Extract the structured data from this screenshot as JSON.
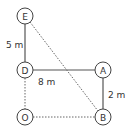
{
  "diagram": {
    "nodes": [
      {
        "id": "E",
        "label": "E"
      },
      {
        "id": "D",
        "label": "D"
      },
      {
        "id": "A",
        "label": "A"
      },
      {
        "id": "O",
        "label": "O"
      },
      {
        "id": "B",
        "label": "B"
      }
    ],
    "edges": [
      {
        "from": "E",
        "to": "D",
        "style": "solid",
        "label": "5 m"
      },
      {
        "from": "D",
        "to": "A",
        "style": "solid",
        "label": "8 m"
      },
      {
        "from": "A",
        "to": "B",
        "style": "solid",
        "label": "2 m"
      },
      {
        "from": "D",
        "to": "O",
        "style": "dotted",
        "label": ""
      },
      {
        "from": "O",
        "to": "B",
        "style": "dotted",
        "label": ""
      },
      {
        "from": "E",
        "to": "B",
        "style": "dotted",
        "label": ""
      }
    ],
    "labels": {
      "ED": "5 m",
      "DA": "8 m",
      "AB": "2 m"
    }
  }
}
